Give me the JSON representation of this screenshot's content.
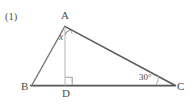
{
  "figure": {
    "item_number": "(1)",
    "caption": "",
    "type": "geometry-diagram",
    "shape": "triangle-with-altitude",
    "colors": {
      "base_line": "#555555",
      "hypotenuse_line": "#5a5a5a",
      "left_side_line": "#7a7a7a",
      "altitude_line": "#b9b9b9",
      "marker": "#9a9a9a",
      "label_text": "#4a4a4a",
      "background": "#ffffff"
    },
    "vertices": [
      {
        "name": "vertex-a",
        "label": "A",
        "x": 65,
        "y": 26
      },
      {
        "name": "vertex-b",
        "label": "B",
        "x": 32,
        "y": 86
      },
      {
        "name": "vertex-c",
        "label": "C",
        "x": 174,
        "y": 85
      },
      {
        "name": "vertex-d",
        "label": "D",
        "x": 65,
        "y": 85
      }
    ],
    "segments": [
      {
        "name": "segment-ab",
        "from": "A",
        "to": "B"
      },
      {
        "name": "segment-ac",
        "from": "A",
        "to": "C"
      },
      {
        "name": "segment-bc",
        "from": "B",
        "to": "C"
      },
      {
        "name": "segment-ad",
        "from": "A",
        "to": "D"
      }
    ],
    "angles": [
      {
        "name": "angle-dac",
        "label": "x",
        "vertex": "A",
        "marker": "arc"
      },
      {
        "name": "angle-adb",
        "label": "",
        "vertex": "D",
        "marker": "right-angle-square"
      },
      {
        "name": "angle-acb",
        "label": "30",
        "degree_symbol": "°",
        "vertex": "C",
        "marker": "arc"
      }
    ],
    "angle_c_text": "30°"
  }
}
